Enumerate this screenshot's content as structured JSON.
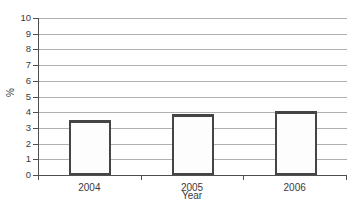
{
  "chart_data": {
    "type": "bar",
    "categories": [
      "2004",
      "2005",
      "2006"
    ],
    "values": [
      3.5,
      3.9,
      4.1
    ],
    "xlabel": "Year",
    "ylabel": "%",
    "ylim": [
      0,
      10
    ],
    "yticks": [
      "0",
      "1",
      "2",
      "3",
      "4",
      "5",
      "6",
      "7",
      "8",
      "9",
      "10"
    ],
    "grid": true,
    "legend": false
  },
  "colors": {
    "background": "#ffffff",
    "gridline": "#b0b0b0",
    "axis": "#4f4f4f",
    "bar_fill": "#fdfdfd",
    "bar_border": "#454545",
    "text": "#3a3a3a"
  }
}
